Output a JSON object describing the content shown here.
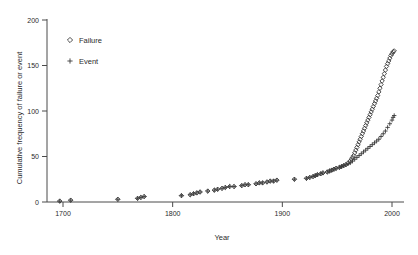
{
  "chart_data": {
    "type": "scatter",
    "title": "",
    "xlabel": "Year",
    "ylabel": "Cumulative frequency of failure or event",
    "xlim": [
      1680,
      2012
    ],
    "ylim": [
      0,
      200
    ],
    "xticks": [
      1700,
      1800,
      1900,
      2000
    ],
    "xtick_labels": [
      "1700",
      "1800",
      "1900",
      "2000"
    ],
    "yticks": [
      0,
      50,
      100,
      150,
      200
    ],
    "ytick_labels": [
      "0",
      "50",
      "100",
      "150",
      "200"
    ],
    "grid": false,
    "legend_position": "top-left-inside",
    "legend": [
      {
        "label": "Failure",
        "marker": "diamond-open"
      },
      {
        "label": "Event",
        "marker": "plus"
      }
    ],
    "series": [
      {
        "name": "Failure",
        "marker": "diamond-open",
        "points": [
          [
            1697,
            1
          ],
          [
            1707,
            2
          ],
          [
            1750,
            3
          ],
          [
            1768,
            4
          ],
          [
            1771,
            5
          ],
          [
            1774,
            6
          ],
          [
            1808,
            7
          ],
          [
            1816,
            8
          ],
          [
            1819,
            9
          ],
          [
            1822,
            10
          ],
          [
            1825,
            11
          ],
          [
            1832,
            12
          ],
          [
            1838,
            13
          ],
          [
            1841,
            14
          ],
          [
            1845,
            15
          ],
          [
            1848,
            16
          ],
          [
            1852,
            17
          ],
          [
            1856,
            17
          ],
          [
            1863,
            18
          ],
          [
            1866,
            19
          ],
          [
            1869,
            19
          ],
          [
            1876,
            20
          ],
          [
            1879,
            21
          ],
          [
            1882,
            21
          ],
          [
            1886,
            22
          ],
          [
            1889,
            23
          ],
          [
            1892,
            23
          ],
          [
            1895,
            24
          ],
          [
            1911,
            25
          ],
          [
            1922,
            26
          ],
          [
            1925,
            27
          ],
          [
            1928,
            28
          ],
          [
            1930,
            29
          ],
          [
            1932,
            30
          ],
          [
            1935,
            31
          ],
          [
            1937,
            32
          ],
          [
            1941,
            33
          ],
          [
            1943,
            34
          ],
          [
            1945,
            35
          ],
          [
            1947,
            36
          ],
          [
            1949,
            37
          ],
          [
            1952,
            38
          ],
          [
            1954,
            39
          ],
          [
            1956,
            40
          ],
          [
            1958,
            41
          ],
          [
            1960,
            43
          ],
          [
            1962,
            45
          ],
          [
            1963,
            47
          ],
          [
            1964,
            49
          ],
          [
            1965,
            51
          ],
          [
            1966,
            54
          ],
          [
            1967,
            57
          ],
          [
            1968,
            60
          ],
          [
            1969,
            63
          ],
          [
            1970,
            66
          ],
          [
            1971,
            69
          ],
          [
            1972,
            72
          ],
          [
            1973,
            75
          ],
          [
            1974,
            78
          ],
          [
            1975,
            81
          ],
          [
            1976,
            84
          ],
          [
            1977,
            87
          ],
          [
            1978,
            90
          ],
          [
            1979,
            93
          ],
          [
            1980,
            96
          ],
          [
            1981,
            99
          ],
          [
            1982,
            102
          ],
          [
            1983,
            105
          ],
          [
            1984,
            108
          ],
          [
            1985,
            111
          ],
          [
            1986,
            114
          ],
          [
            1987,
            117
          ],
          [
            1988,
            121
          ],
          [
            1989,
            125
          ],
          [
            1990,
            129
          ],
          [
            1991,
            133
          ],
          [
            1992,
            137
          ],
          [
            1993,
            141
          ],
          [
            1994,
            145
          ],
          [
            1995,
            149
          ],
          [
            1996,
            152
          ],
          [
            1997,
            155
          ],
          [
            1998,
            158
          ],
          [
            1999,
            161
          ],
          [
            2000,
            163
          ],
          [
            2001,
            165
          ],
          [
            2002,
            166
          ]
        ]
      },
      {
        "name": "Event",
        "marker": "plus",
        "points": [
          [
            1697,
            1
          ],
          [
            1707,
            2
          ],
          [
            1750,
            3
          ],
          [
            1768,
            4
          ],
          [
            1771,
            5
          ],
          [
            1774,
            6
          ],
          [
            1808,
            7
          ],
          [
            1816,
            8
          ],
          [
            1819,
            9
          ],
          [
            1822,
            10
          ],
          [
            1825,
            11
          ],
          [
            1832,
            12
          ],
          [
            1838,
            13
          ],
          [
            1841,
            14
          ],
          [
            1845,
            15
          ],
          [
            1848,
            16
          ],
          [
            1852,
            17
          ],
          [
            1856,
            17
          ],
          [
            1863,
            18
          ],
          [
            1866,
            19
          ],
          [
            1869,
            19
          ],
          [
            1876,
            20
          ],
          [
            1879,
            21
          ],
          [
            1882,
            21
          ],
          [
            1886,
            22
          ],
          [
            1889,
            23
          ],
          [
            1892,
            23
          ],
          [
            1895,
            24
          ],
          [
            1911,
            25
          ],
          [
            1922,
            26
          ],
          [
            1925,
            27
          ],
          [
            1928,
            28
          ],
          [
            1930,
            29
          ],
          [
            1932,
            30
          ],
          [
            1935,
            31
          ],
          [
            1937,
            32
          ],
          [
            1941,
            33
          ],
          [
            1943,
            34
          ],
          [
            1945,
            35
          ],
          [
            1947,
            36
          ],
          [
            1949,
            37
          ],
          [
            1952,
            38
          ],
          [
            1954,
            39
          ],
          [
            1956,
            40
          ],
          [
            1958,
            41
          ],
          [
            1960,
            42
          ],
          [
            1962,
            43
          ],
          [
            1964,
            45
          ],
          [
            1966,
            47
          ],
          [
            1968,
            49
          ],
          [
            1970,
            51
          ],
          [
            1972,
            53
          ],
          [
            1974,
            55
          ],
          [
            1976,
            57
          ],
          [
            1978,
            59
          ],
          [
            1980,
            61
          ],
          [
            1982,
            63
          ],
          [
            1984,
            65
          ],
          [
            1986,
            67
          ],
          [
            1988,
            69
          ],
          [
            1990,
            72
          ],
          [
            1992,
            75
          ],
          [
            1994,
            78
          ],
          [
            1996,
            82
          ],
          [
            1998,
            86
          ],
          [
            2000,
            90
          ],
          [
            2001,
            93
          ],
          [
            2002,
            95
          ]
        ]
      }
    ]
  },
  "axes": {
    "x_title": "Year",
    "y_title": "Cumulative frequency of failure or event"
  }
}
